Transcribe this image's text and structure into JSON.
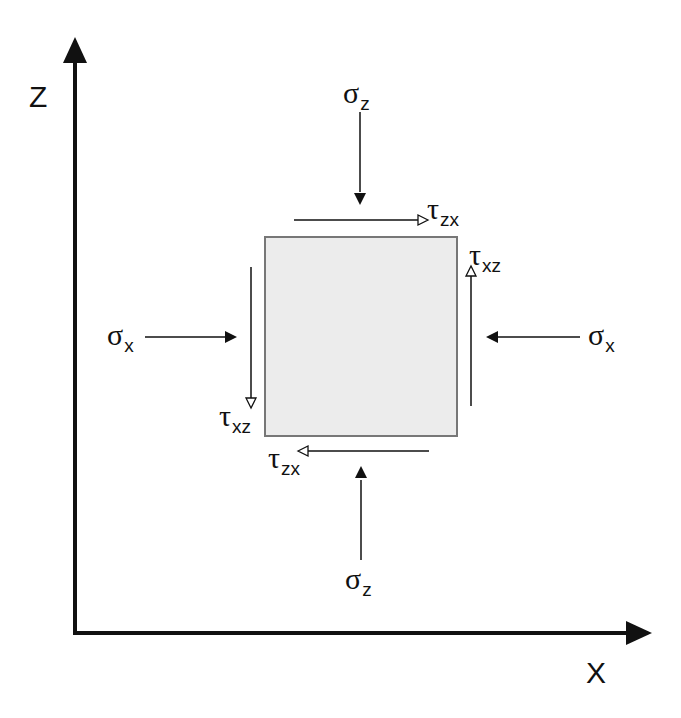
{
  "axes": {
    "vertical_label": "Z",
    "horizontal_label": "X"
  },
  "element": {
    "fill_color": "#ececec",
    "border_color": "#777777"
  },
  "labels": {
    "sigma_z_top": {
      "symbol": "σ",
      "subscript": "z"
    },
    "sigma_z_bottom": {
      "symbol": "σ",
      "subscript": "z"
    },
    "sigma_x_left": {
      "symbol": "σ",
      "subscript": "x"
    },
    "sigma_x_right": {
      "symbol": "σ",
      "subscript": "x"
    },
    "tau_zx_top": {
      "symbol": "τ",
      "subscript": "zx"
    },
    "tau_zx_bottom": {
      "symbol": "τ",
      "subscript": "zx"
    },
    "tau_xz_right": {
      "symbol": "τ",
      "subscript": "xz"
    },
    "tau_xz_left": {
      "symbol": "τ",
      "subscript": "xz"
    }
  },
  "colors": {
    "line": "#111111",
    "background": "#ffffff"
  }
}
